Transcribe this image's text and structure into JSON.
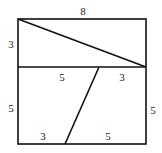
{
  "diagram": {
    "title": "",
    "shapes": {
      "outer_box": {
        "x": 18,
        "y": 19,
        "width": 128,
        "height": 125
      },
      "divider": {
        "y": 67
      },
      "top_diagonal": {
        "x1": 18,
        "y1": 19,
        "x2": 146,
        "y2": 67
      },
      "bottom_slant": {
        "x1": 99,
        "y1": 67,
        "x2": 65,
        "y2": 144
      }
    },
    "labels": {
      "top_width": "8",
      "top_left_height": "3",
      "mid_left_segment": "5",
      "mid_right_segment": "3",
      "bottom_left_height": "5",
      "bottom_right_height": "5",
      "bottom_left_segment": "3",
      "bottom_right_segment": "5"
    },
    "colors": {
      "stroke": "#111111",
      "text": "#222222",
      "background": "#ffffff"
    }
  }
}
